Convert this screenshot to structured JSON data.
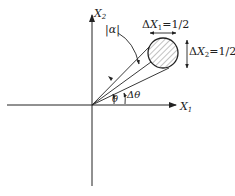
{
  "diagram": {
    "axis_x_label": "X",
    "axis_x_sub": "1",
    "axis_y_label": "X",
    "axis_y_sub": "2",
    "alpha_label": "|α|",
    "theta_label": "θ",
    "delta_theta_label": "Δθ",
    "dx1_prefix": "Δ",
    "dx1_var": "X",
    "dx1_sub": "1",
    "dx1_value": "=1/2",
    "dx2_prefix": "Δ",
    "dx2_var": "X",
    "dx2_sub": "2",
    "dx2_value": "=1/2",
    "colors": {
      "ink": "#222222",
      "hatch": "#555555"
    }
  }
}
